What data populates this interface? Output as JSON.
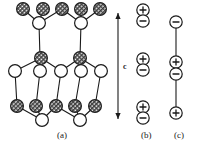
{
  "figure": {
    "background_color": "#ffffff",
    "line_color": "#1a1a1a",
    "hatched_fill": "#8a8a8a",
    "open_fill": "#ffffff",
    "width": 197,
    "height": 145
  },
  "panels": [
    {
      "id": "a",
      "label": "(a)",
      "label_x": 57,
      "label_y": 130
    },
    {
      "id": "b",
      "label": "(b)",
      "label_x": 141,
      "label_y": 130
    },
    {
      "id": "c",
      "label": "(c)",
      "label_x": 174,
      "label_y": 130
    }
  ],
  "axis": {
    "name": "c",
    "label": "c",
    "label_x": 123,
    "label_y": 62,
    "arrow_x": 118,
    "arrow_top_y": 13,
    "arrow_bottom_y": 119,
    "double_headed": true
  },
  "panel_a": {
    "atom_radius": 6.4,
    "hatched_atoms": [
      {
        "x": 23,
        "y": 9
      },
      {
        "x": 43,
        "y": 9
      },
      {
        "x": 62,
        "y": 9
      },
      {
        "x": 81,
        "y": 9
      },
      {
        "x": 100,
        "y": 9
      },
      {
        "x": 41,
        "y": 58
      },
      {
        "x": 80,
        "y": 58
      },
      {
        "x": 17,
        "y": 106
      },
      {
        "x": 36,
        "y": 106
      },
      {
        "x": 56,
        "y": 106
      },
      {
        "x": 75,
        "y": 106
      },
      {
        "x": 95,
        "y": 106
      }
    ],
    "open_atoms": [
      {
        "x": 39,
        "y": 23
      },
      {
        "x": 81,
        "y": 23
      },
      {
        "x": 15,
        "y": 71
      },
      {
        "x": 40,
        "y": 71
      },
      {
        "x": 61,
        "y": 71
      },
      {
        "x": 81,
        "y": 71
      },
      {
        "x": 101,
        "y": 71
      },
      {
        "x": 42,
        "y": 120
      },
      {
        "x": 80,
        "y": 120
      }
    ],
    "bonds": [
      {
        "x1": 23,
        "y1": 9,
        "x2": 39,
        "y2": 23
      },
      {
        "x1": 43,
        "y1": 9,
        "x2": 39,
        "y2": 23
      },
      {
        "x1": 62,
        "y1": 9,
        "x2": 39,
        "y2": 23
      },
      {
        "x1": 62,
        "y1": 9,
        "x2": 81,
        "y2": 23
      },
      {
        "x1": 81,
        "y1": 9,
        "x2": 81,
        "y2": 23
      },
      {
        "x1": 100,
        "y1": 9,
        "x2": 81,
        "y2": 23
      },
      {
        "x1": 39,
        "y1": 23,
        "x2": 40,
        "y2": 58
      },
      {
        "x1": 81,
        "y1": 23,
        "x2": 80,
        "y2": 58
      },
      {
        "x1": 41,
        "y1": 58,
        "x2": 15,
        "y2": 71
      },
      {
        "x1": 41,
        "y1": 58,
        "x2": 40,
        "y2": 71
      },
      {
        "x1": 41,
        "y1": 58,
        "x2": 61,
        "y2": 71
      },
      {
        "x1": 80,
        "y1": 58,
        "x2": 61,
        "y2": 71
      },
      {
        "x1": 80,
        "y1": 58,
        "x2": 81,
        "y2": 71
      },
      {
        "x1": 80,
        "y1": 58,
        "x2": 101,
        "y2": 71
      },
      {
        "x1": 15,
        "y1": 71,
        "x2": 17,
        "y2": 106
      },
      {
        "x1": 40,
        "y1": 71,
        "x2": 36,
        "y2": 106
      },
      {
        "x1": 61,
        "y1": 71,
        "x2": 56,
        "y2": 106
      },
      {
        "x1": 81,
        "y1": 71,
        "x2": 75,
        "y2": 106
      },
      {
        "x1": 101,
        "y1": 71,
        "x2": 95,
        "y2": 106
      },
      {
        "x1": 17,
        "y1": 106,
        "x2": 42,
        "y2": 120
      },
      {
        "x1": 36,
        "y1": 106,
        "x2": 42,
        "y2": 120
      },
      {
        "x1": 56,
        "y1": 106,
        "x2": 42,
        "y2": 120
      },
      {
        "x1": 56,
        "y1": 106,
        "x2": 80,
        "y2": 120
      },
      {
        "x1": 75,
        "y1": 106,
        "x2": 80,
        "y2": 120
      },
      {
        "x1": 95,
        "y1": 106,
        "x2": 80,
        "y2": 120
      }
    ]
  },
  "panel_b": {
    "center_x": 143,
    "charge_radius": 6.2,
    "charges": [
      {
        "sign": "+",
        "x": 143,
        "y": 10
      },
      {
        "sign": "−",
        "x": 143,
        "y": 21
      },
      {
        "sign": "+",
        "x": 143,
        "y": 59
      },
      {
        "sign": "−",
        "x": 143,
        "y": 70
      },
      {
        "sign": "+",
        "x": 143,
        "y": 107
      },
      {
        "sign": "−",
        "x": 143,
        "y": 118
      }
    ],
    "connectors": []
  },
  "panel_c": {
    "center_x": 176,
    "charge_radius": 6.2,
    "charges": [
      {
        "sign": "−",
        "x": 176,
        "y": 22
      },
      {
        "sign": "+",
        "x": 176,
        "y": 62
      },
      {
        "sign": "−",
        "x": 176,
        "y": 74
      },
      {
        "sign": "+",
        "x": 176,
        "y": 113
      }
    ],
    "connectors": [
      {
        "x1": 176,
        "y1": 28,
        "x2": 176,
        "y2": 56
      },
      {
        "x1": 176,
        "y1": 80,
        "x2": 176,
        "y2": 107
      }
    ]
  }
}
